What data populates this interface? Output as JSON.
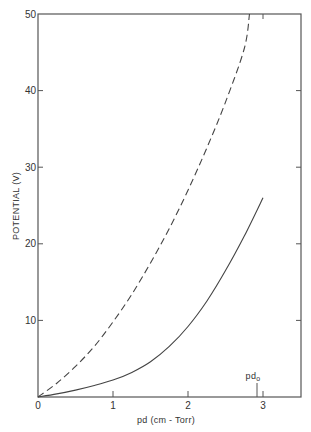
{
  "chart_data": {
    "type": "line",
    "title": "",
    "xlabel": "pd (cm - Torr)",
    "ylabel": "POTENTIAL (V)",
    "xlim": [
      0,
      3.5
    ],
    "ylim": [
      0,
      50
    ],
    "xticks": [
      0,
      1,
      2,
      3
    ],
    "xtick_labels": [
      "0",
      "1",
      "2",
      "3"
    ],
    "yticks": [
      10,
      20,
      30,
      40,
      50
    ],
    "ytick_labels": [
      "10",
      "20",
      "30",
      "40",
      "50"
    ],
    "grid": false,
    "legend": null,
    "annotations": [
      {
        "text": "pd",
        "subscript": "o",
        "x": 2.93,
        "marker": "vertical tick above x-axis"
      }
    ],
    "series": [
      {
        "name": "dashed",
        "style": "dashed",
        "x": [
          0,
          0.25,
          0.5,
          0.75,
          1.0,
          1.25,
          1.5,
          1.75,
          2.0,
          2.25,
          2.5,
          2.75,
          2.82
        ],
        "y": [
          0,
          1.8,
          4.0,
          6.6,
          9.8,
          13.4,
          17.5,
          22.0,
          27.0,
          32.5,
          38.5,
          45.5,
          50
        ]
      },
      {
        "name": "solid",
        "style": "solid",
        "x": [
          0,
          0.25,
          0.5,
          0.75,
          1.0,
          1.25,
          1.5,
          1.75,
          2.0,
          2.25,
          2.5,
          2.75,
          3.0
        ],
        "y": [
          0,
          0.4,
          0.9,
          1.5,
          2.2,
          3.2,
          4.6,
          6.6,
          9.2,
          12.5,
          16.5,
          21.0,
          26.0
        ]
      }
    ]
  },
  "labels": {
    "ylabel": "POTENTIAL (V)",
    "xlabel": "pd (cm - Torr)",
    "pd0_main": "pd",
    "pd0_sub": "o",
    "x0": "0",
    "x1": "1",
    "x2": "2",
    "x3": "3",
    "y10": "10",
    "y20": "20",
    "y30": "30",
    "y40": "40",
    "y50": "50"
  },
  "colors": {
    "axis": "#555555",
    "line": "#444444"
  }
}
